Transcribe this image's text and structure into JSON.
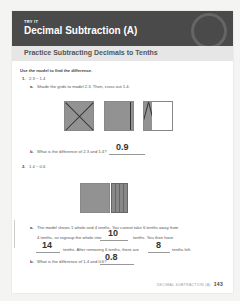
{
  "header": {
    "kicker": "TRY IT",
    "title": "Decimal Subtraction (A)"
  },
  "section": {
    "title": "Practice Subtracting Decimals to Tenths"
  },
  "instructions": "Use the model to find the difference.",
  "problems": [
    {
      "number": "1.",
      "expression": "2.3 − 1.4",
      "parts": [
        {
          "letter": "a.",
          "text": "Shade the grids to model 2.3. Then, cross out 1.4."
        },
        {
          "letter": "b.",
          "text": "What is the difference of 2.3 and 1.4?",
          "answer": "0.9"
        }
      ]
    },
    {
      "number": "2.",
      "expression": "1.4 − 0.6",
      "parts": [
        {
          "letter": "a.",
          "line1": "The model shows 1 whole and 4 tenths. You cannot take 6 tenths away from",
          "line2_pre": "4 tenths, so regroup the whole into",
          "answer1": "10",
          "line2_post": "tenths. You then have",
          "answer2": "14",
          "line3_mid": "tenths. After removing 6 tenths, there are",
          "answer3": "8",
          "line3_post": "tenths left."
        },
        {
          "letter": "b.",
          "text": "What is the difference of 1.4 and 0.6?",
          "answer": "0.8"
        }
      ]
    }
  ],
  "footer": {
    "label": "DECIMAL SUBTRACTION (A)",
    "page": "143"
  }
}
